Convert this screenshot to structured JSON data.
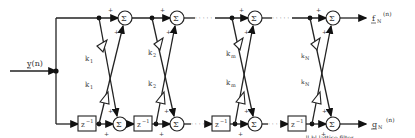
{
  "diagram": {
    "type": "lattice-filter",
    "input": {
      "label": "y(n)"
    },
    "outputs": {
      "forward": "f",
      "forward_sub": "N",
      "forward_arg": "(n)",
      "backward": "g",
      "backward_sub": "N",
      "backward_arg": "(n)"
    },
    "sum_symbol": "Σ",
    "delay_label": "z",
    "delay_exp": "−1",
    "plus": "+",
    "ellipsis": "· · · · ·",
    "stages": [
      {
        "id": "1",
        "gain": "k",
        "sub": "1"
      },
      {
        "id": "2",
        "gain": "k",
        "sub": "2"
      },
      {
        "id": "m",
        "gain": "k",
        "sub": "m"
      },
      {
        "id": "N",
        "gain": "k",
        "sub": "N"
      }
    ],
    "caption": "...ll-bl-lattice filter"
  }
}
